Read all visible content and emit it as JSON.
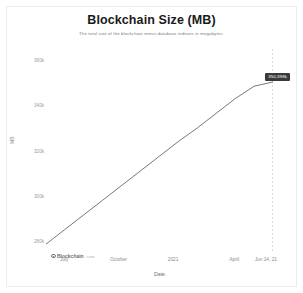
{
  "chart_data": {
    "type": "line",
    "title": "Blockchain Size (MB)",
    "subtitle": "The total size of the blockchain minus database indexes in megabytes.",
    "xlabel": "Date",
    "ylabel": "MB",
    "ylim": [
      275000,
      365000
    ],
    "y_ticks": [
      {
        "label": "360k",
        "value": 360000
      },
      {
        "label": "340k",
        "value": 340000
      },
      {
        "label": "320k",
        "value": 320000
      },
      {
        "label": "300k",
        "value": 300000
      },
      {
        "label": "280k",
        "value": 280000
      }
    ],
    "x_ticks": [
      {
        "label": "July",
        "pos": 0.08
      },
      {
        "label": "October",
        "pos": 0.32
      },
      {
        "label": "2021",
        "pos": 0.56
      },
      {
        "label": "April",
        "pos": 0.83
      },
      {
        "label": "Jun 14, 21",
        "pos": 1.0
      }
    ],
    "grid": false,
    "legend": "none",
    "line_color": "#555555",
    "marker_line_color": "#c9c9d6",
    "series": [
      {
        "name": "Blockchain Size",
        "x": [
          "Jun 2020",
          "Jul 2020",
          "Aug 2020",
          "Sep 2020",
          "Oct 2020",
          "Nov 2020",
          "Dec 2020",
          "Jan 2021",
          "Feb 2021",
          "Mar 2021",
          "Apr 2021",
          "May 2021",
          "Jun 14, 2021"
        ],
        "values": [
          278500,
          285000,
          291500,
          298000,
          304500,
          311000,
          317500,
          324000,
          330000,
          336500,
          343000,
          348500,
          350398
        ]
      }
    ],
    "endpoint_label": "350,398k",
    "endpoint_value": 350398
  },
  "watermark": {
    "name": "Blockchain",
    "suffix": ".com"
  }
}
